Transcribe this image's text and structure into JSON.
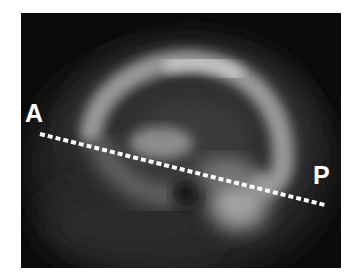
{
  "image": {
    "description": "Sagittal grayscale brain scan with dotted anterior-posterior line",
    "background_color": "#0b0b0b",
    "line_color": "#ffffff"
  },
  "labels": {
    "anterior": "A",
    "posterior": "P"
  },
  "ap_line": {
    "start": [
      19,
      121
    ],
    "end": [
      304,
      192
    ],
    "style": "dotted"
  }
}
